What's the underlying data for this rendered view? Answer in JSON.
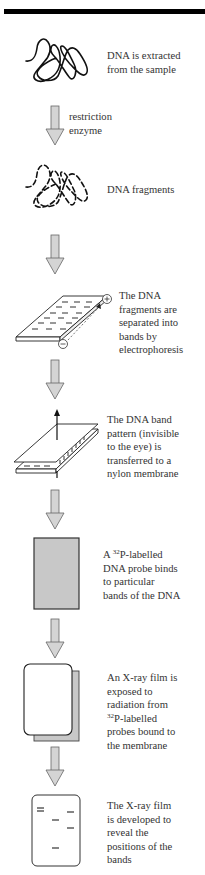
{
  "figure": {
    "arrow_color": "#d4d4d4",
    "arrow_stroke": "#666666",
    "probe_fill": "#c8c8c8",
    "film_back_fill": "#c8c8c8"
  },
  "steps": [
    {
      "id": "extract",
      "icon": "dna-strand-icon",
      "lines": [
        "DNA is extracted",
        "from the sample"
      ]
    },
    {
      "id": "enzyme",
      "icon": "down-arrow-icon",
      "lines": [
        "restriction",
        "enzyme"
      ]
    },
    {
      "id": "fragments",
      "icon": "dna-fragments-icon",
      "lines": [
        "DNA fragments"
      ]
    },
    {
      "id": "electrophoresis",
      "icon": "gel-electrophoresis-icon",
      "lines": [
        "The DNA",
        "fragments are",
        "separated into",
        "bands by",
        "electrophoresis"
      ],
      "plus": "+",
      "minus": "−"
    },
    {
      "id": "transfer",
      "icon": "membrane-transfer-icon",
      "lines": [
        "The DNA band",
        "pattern (invisible",
        "to the eye) is",
        "transferred to a",
        "nylon membrane"
      ]
    },
    {
      "id": "probe",
      "icon": "probe-membrane-icon",
      "lines_sup": [
        {
          "pre": "A ",
          "sup": "32",
          "post": "P-labelled"
        }
      ],
      "lines": [
        "DNA probe binds",
        "to particular",
        "bands of the DNA"
      ]
    },
    {
      "id": "xray",
      "icon": "xray-film-icon",
      "lines_top": [
        "An X-ray film is",
        "exposed to",
        "radiation from"
      ],
      "lines_sup": [
        {
          "pre": "",
          "sup": "32",
          "post": "P-labelled"
        }
      ],
      "lines": [
        "probes bound to",
        "the membrane"
      ]
    },
    {
      "id": "develop",
      "icon": "developed-film-icon",
      "lines": [
        "The X-ray film",
        "is developed to",
        "reveal the",
        "positions of the",
        "bands"
      ]
    }
  ]
}
